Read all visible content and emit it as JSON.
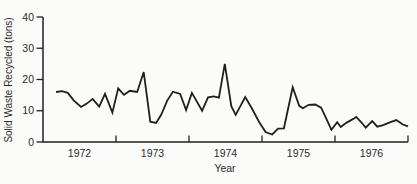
{
  "chart_data": {
    "type": "line",
    "title": "",
    "xlabel": "Year",
    "ylabel": "Solid Waste Recycled (tons)",
    "x_tick_labels": [
      "1972",
      "1973",
      "1974",
      "1975",
      "1976"
    ],
    "y_ticks": [
      0,
      10,
      20,
      30,
      40
    ],
    "xlim": [
      1972,
      1977
    ],
    "ylim": [
      0,
      40
    ],
    "grid": false,
    "legend": false,
    "line_color": "#1f1f1f",
    "axis_color": "#222222",
    "points": [
      [
        1972.18,
        16.0
      ],
      [
        1972.26,
        16.3
      ],
      [
        1972.34,
        15.7
      ],
      [
        1972.42,
        13.3
      ],
      [
        1972.52,
        11.2
      ],
      [
        1972.6,
        12.3
      ],
      [
        1972.68,
        13.8
      ],
      [
        1972.77,
        11.3
      ],
      [
        1972.85,
        15.4
      ],
      [
        1972.95,
        9.4
      ],
      [
        1973.03,
        17.2
      ],
      [
        1973.11,
        15.1
      ],
      [
        1973.19,
        16.4
      ],
      [
        1973.29,
        16.0
      ],
      [
        1973.38,
        22.4
      ],
      [
        1973.47,
        6.5
      ],
      [
        1973.55,
        6.1
      ],
      [
        1973.62,
        8.8
      ],
      [
        1973.7,
        13.2
      ],
      [
        1973.78,
        16.1
      ],
      [
        1973.88,
        15.4
      ],
      [
        1973.96,
        10.2
      ],
      [
        1974.04,
        15.7
      ],
      [
        1974.18,
        10.0
      ],
      [
        1974.26,
        14.3
      ],
      [
        1974.34,
        14.6
      ],
      [
        1974.41,
        14.2
      ],
      [
        1974.49,
        25.0
      ],
      [
        1974.58,
        11.5
      ],
      [
        1974.64,
        8.7
      ],
      [
        1974.77,
        14.4
      ],
      [
        1974.86,
        10.8
      ],
      [
        1974.96,
        6.4
      ],
      [
        1975.05,
        3.2
      ],
      [
        1975.14,
        2.4
      ],
      [
        1975.22,
        4.3
      ],
      [
        1975.3,
        4.4
      ],
      [
        1975.42,
        17.5
      ],
      [
        1975.51,
        11.6
      ],
      [
        1975.56,
        10.8
      ],
      [
        1975.64,
        11.9
      ],
      [
        1975.73,
        12.0
      ],
      [
        1975.81,
        11.0
      ],
      [
        1975.89,
        7.0
      ],
      [
        1975.95,
        3.9
      ],
      [
        1976.03,
        6.3
      ],
      [
        1976.08,
        4.8
      ],
      [
        1976.16,
        6.2
      ],
      [
        1976.25,
        7.4
      ],
      [
        1976.29,
        8.0
      ],
      [
        1976.36,
        6.3
      ],
      [
        1976.42,
        4.6
      ],
      [
        1976.51,
        6.7
      ],
      [
        1976.58,
        4.9
      ],
      [
        1976.66,
        5.4
      ],
      [
        1976.75,
        6.3
      ],
      [
        1976.84,
        7.0
      ],
      [
        1976.93,
        5.6
      ],
      [
        1977.0,
        5.0
      ]
    ]
  },
  "colors": {
    "background": "#fbfbf9",
    "ink": "#2b2b2b"
  }
}
